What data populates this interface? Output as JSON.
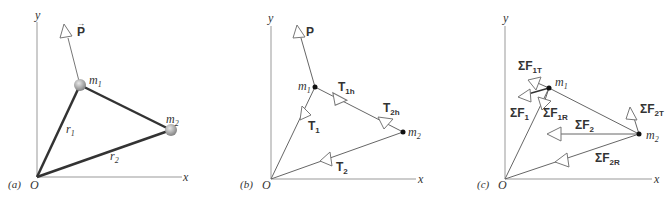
{
  "figure": {
    "panels": [
      {
        "id": "a",
        "panel_label": "(a)",
        "origin_label": "O",
        "x_axis_label": "x",
        "y_axis_label": "y",
        "masses": [
          {
            "label": "m",
            "sub": "1"
          },
          {
            "label": "m",
            "sub": "2"
          }
        ],
        "position_vectors": [
          {
            "label": "r",
            "sub": "1"
          },
          {
            "label": "r",
            "sub": "2"
          }
        ],
        "force_label": "P"
      },
      {
        "id": "b",
        "panel_label": "(b)",
        "origin_label": "O",
        "x_axis_label": "x",
        "y_axis_label": "y",
        "masses": [
          {
            "label": "m",
            "sub": "1"
          },
          {
            "label": "m",
            "sub": "2"
          }
        ],
        "force_label": "P",
        "tensions": [
          {
            "label": "T",
            "sub": "1"
          },
          {
            "label": "T",
            "sub": "1h"
          },
          {
            "label": "T",
            "sub": "2h"
          },
          {
            "label": "T",
            "sub": "2"
          }
        ]
      },
      {
        "id": "c",
        "panel_label": "(c)",
        "origin_label": "O",
        "x_axis_label": "x",
        "y_axis_label": "y",
        "masses": [
          {
            "label": "m",
            "sub": "1"
          },
          {
            "label": "m",
            "sub": "2"
          }
        ],
        "net_forces": [
          {
            "label": "ΣF",
            "sub": "1T"
          },
          {
            "label": "ΣF",
            "sub": "1"
          },
          {
            "label": "ΣF",
            "sub": "1R"
          },
          {
            "label": "ΣF",
            "sub": "2"
          },
          {
            "label": "ΣF",
            "sub": "2T"
          },
          {
            "label": "ΣF",
            "sub": "2R"
          }
        ]
      }
    ]
  }
}
